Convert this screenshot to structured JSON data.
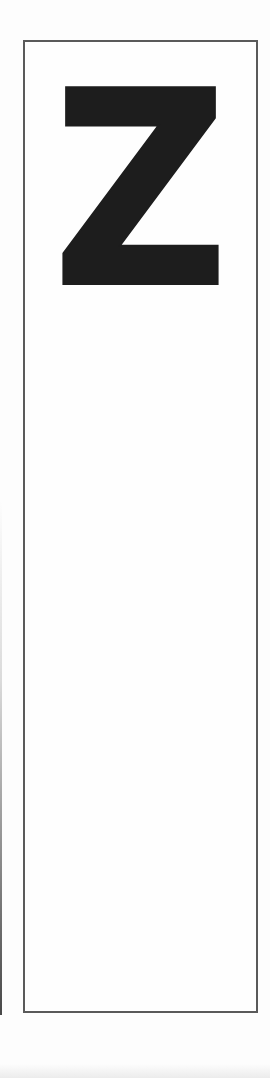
{
  "card": {
    "letter": "Z"
  },
  "colors": {
    "background": "#fdfdfd",
    "card_border": "#5a5a5a",
    "letter": "#1d1d1d"
  }
}
